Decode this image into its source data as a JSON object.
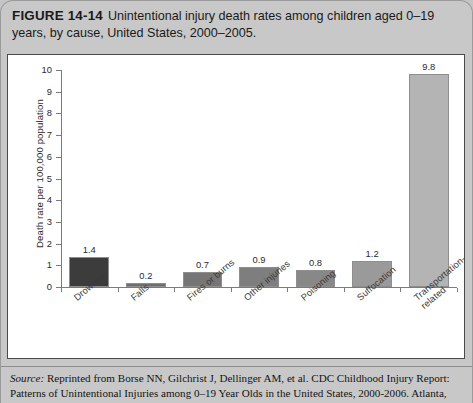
{
  "figure": {
    "number": "FIGURE 14-14",
    "caption": "Unintentional injury death rates among children aged 0–19 years, by cause, United States, 2000–2005."
  },
  "source": {
    "label": "Source:",
    "line1": "Reprinted from Borse NN, Gilchrist J, Dellinger AM, et al. CDC Childhood Injury Report: Patterns",
    "line2": "of Unintentional Injuries among 0–19 Year Olds in the United States, 2000-2006. Atlanta, GA: Centers for"
  },
  "chart_data": {
    "type": "bar",
    "title": "Unintentional injury death rates among children aged 0–19 years, by cause, United States, 2000–2005.",
    "xlabel": "",
    "ylabel": "Death rate per 100,000 population",
    "ylim": [
      0,
      10
    ],
    "yticks": [
      "0",
      "1",
      "2",
      "3",
      "4",
      "5",
      "6",
      "7",
      "8",
      "9",
      "10"
    ],
    "grid": false,
    "legend": "none",
    "categories": [
      "Drowning",
      "Falls",
      "Fires or burns",
      "Other injuries",
      "Poisoning",
      "Suffocation",
      "Transportation-\nrelated"
    ],
    "values": [
      1.4,
      0.2,
      0.7,
      0.9,
      0.8,
      1.2,
      9.8
    ],
    "value_labels": [
      "1.4",
      "0.2",
      "0.7",
      "0.9",
      "0.8",
      "1.2",
      "9.8"
    ],
    "bar_colors": [
      "#3c3c3c",
      "#6e6e6e",
      "#767676",
      "#7e7e7e",
      "#888888",
      "#9a9a9a",
      "#b4b4b4"
    ]
  }
}
